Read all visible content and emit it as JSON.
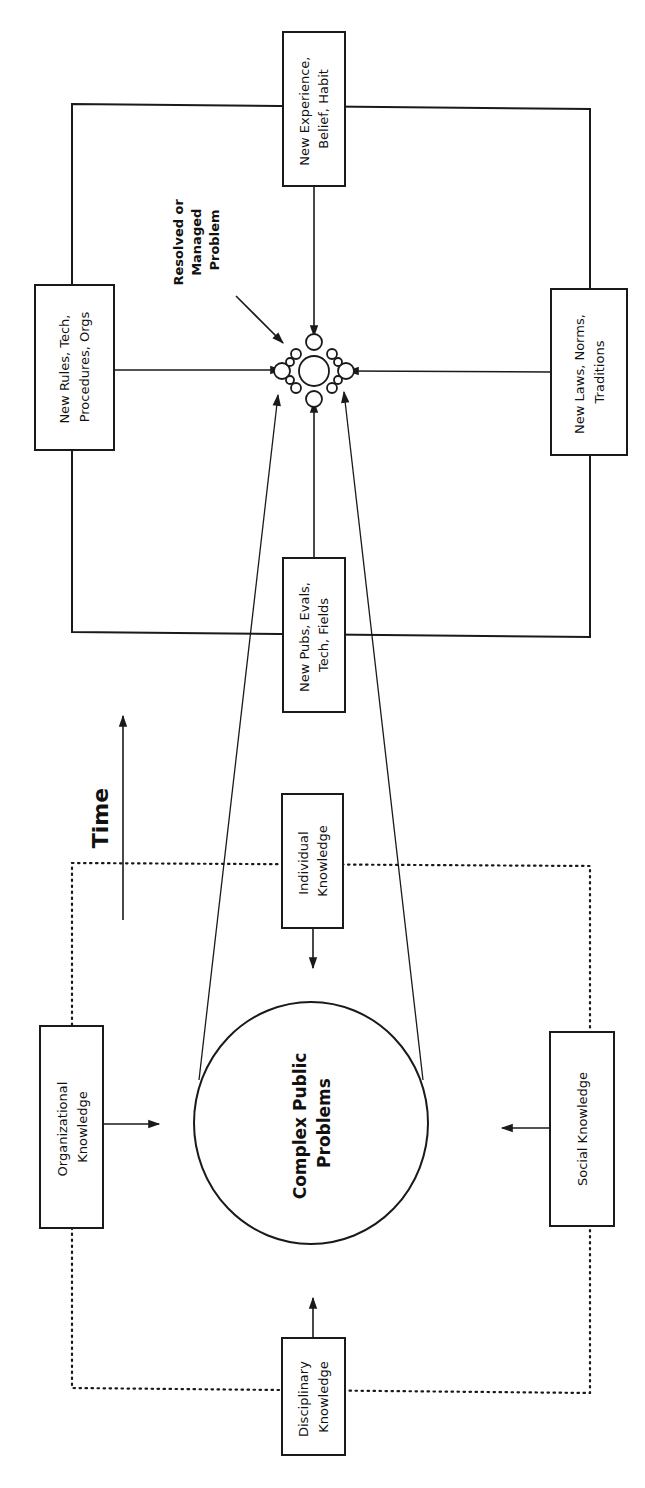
{
  "diagram": {
    "time_label": "Time",
    "center": {
      "lines": [
        "Complex Public",
        "Problems"
      ]
    },
    "outcome": {
      "lines": [
        "Resolved or",
        "Managed",
        "Problem"
      ]
    },
    "knowledge_sources": [
      {
        "id": "organizational",
        "lines": [
          "Organizational",
          "Knowledge"
        ]
      },
      {
        "id": "individual",
        "lines": [
          "Individual",
          "Knowledge"
        ]
      },
      {
        "id": "social",
        "lines": [
          "Social Knowledge"
        ]
      },
      {
        "id": "disciplinary",
        "lines": [
          "Disciplinary",
          "Knowledge"
        ]
      }
    ],
    "outputs": [
      {
        "id": "new-rules",
        "lines": [
          "New Rules, Tech,",
          "Procedures, Orgs"
        ]
      },
      {
        "id": "new-experience",
        "lines": [
          "New Experience,",
          "Belief, Habit"
        ]
      },
      {
        "id": "new-laws",
        "lines": [
          "New Laws, Norms,",
          "Traditions"
        ]
      },
      {
        "id": "new-pubs",
        "lines": [
          "New Pubs, Evals,",
          "Tech, Fields"
        ]
      }
    ]
  }
}
